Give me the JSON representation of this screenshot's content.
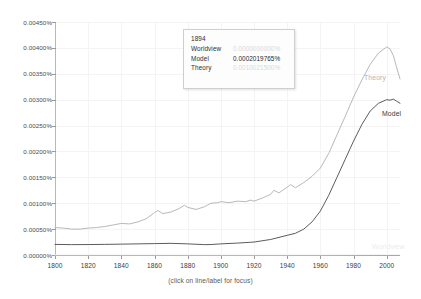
{
  "chart_data": {
    "type": "line",
    "title": "",
    "xlabel": "",
    "ylabel": "",
    "xlim": [
      1800,
      2008
    ],
    "ylim": [
      0,
      0.0045
    ],
    "grid": true,
    "legend_position": "line-end-labels",
    "y_tick_labels": [
      "0.00450%",
      "0.00400%",
      "0.00350%",
      "0.00300%",
      "0.00250%",
      "0.00200%",
      "0.00150%",
      "0.00100%",
      "0.00050%",
      "0.00000%"
    ],
    "y_tick_values": [
      0.0045,
      0.004,
      0.0035,
      0.003,
      0.0025,
      0.002,
      0.0015,
      0.001,
      0.0005,
      0.0
    ],
    "x_tick_labels": [
      "1800",
      "1820",
      "1840",
      "1860",
      "1880",
      "1900",
      "1920",
      "1940",
      "1960",
      "1980",
      "2000"
    ],
    "x_tick_values": [
      1800,
      1820,
      1840,
      1860,
      1880,
      1900,
      1920,
      1940,
      1960,
      1980,
      2000
    ],
    "series": [
      {
        "name": "Theory",
        "color": "#b0b0b0",
        "x": [
          1800,
          1805,
          1810,
          1815,
          1820,
          1825,
          1830,
          1835,
          1840,
          1845,
          1850,
          1855,
          1860,
          1862,
          1865,
          1870,
          1875,
          1878,
          1880,
          1885,
          1890,
          1894,
          1898,
          1900,
          1905,
          1910,
          1915,
          1918,
          1920,
          1925,
          1930,
          1932,
          1935,
          1940,
          1942,
          1945,
          1950,
          1955,
          1960,
          1965,
          1970,
          1975,
          1980,
          1985,
          1990,
          1995,
          2000,
          2002,
          2004,
          2006,
          2008
        ],
        "y": [
          0.00053,
          0.00052,
          0.0005,
          0.0005,
          0.00052,
          0.00053,
          0.00055,
          0.00058,
          0.00061,
          0.0006,
          0.00064,
          0.0007,
          0.00082,
          0.00086,
          0.0008,
          0.00083,
          0.0009,
          0.00096,
          0.00092,
          0.00088,
          0.00093,
          0.001,
          0.00101,
          0.00103,
          0.00101,
          0.00104,
          0.00103,
          0.00106,
          0.00104,
          0.0011,
          0.00117,
          0.00125,
          0.0012,
          0.00131,
          0.00136,
          0.0013,
          0.0014,
          0.00152,
          0.00168,
          0.00196,
          0.00232,
          0.00268,
          0.00305,
          0.00338,
          0.00368,
          0.0039,
          0.00402,
          0.00398,
          0.00385,
          0.00362,
          0.0034
        ]
      },
      {
        "name": "Model",
        "color": "#4a4a4a",
        "x": [
          1800,
          1810,
          1820,
          1830,
          1840,
          1850,
          1860,
          1870,
          1880,
          1890,
          1894,
          1900,
          1910,
          1920,
          1930,
          1940,
          1945,
          1950,
          1955,
          1960,
          1965,
          1970,
          1975,
          1980,
          1985,
          1990,
          1995,
          2000,
          2002,
          2004,
          2006,
          2008
        ],
        "y": [
          0.000205,
          0.0002,
          0.000202,
          0.000205,
          0.00021,
          0.000215,
          0.00022,
          0.000225,
          0.000215,
          0.0002,
          0.0002019765,
          0.000215,
          0.00023,
          0.00025,
          0.0003,
          0.00038,
          0.00042,
          0.0005,
          0.00064,
          0.00085,
          0.00115,
          0.0015,
          0.00185,
          0.0022,
          0.00252,
          0.00278,
          0.00293,
          0.003,
          0.00299,
          0.00301,
          0.00297,
          0.00293
        ]
      },
      {
        "name": "Worldview",
        "color": "#ededed",
        "x": [
          1800,
          1850,
          1900,
          1920,
          1940,
          1950,
          1960,
          1970,
          1980,
          1990,
          2000,
          2008
        ],
        "y": [
          0.0,
          0.0,
          0.0,
          0.0,
          0.0,
          2e-07,
          6e-07,
          1.2e-06,
          1.9e-06,
          2.6e-06,
          3.1e-06,
          3.3e-06
        ]
      }
    ]
  },
  "tooltip": {
    "year": "1894",
    "rows": [
      {
        "name": "Worldview",
        "value": "0.0000000000%",
        "state": "dim"
      },
      {
        "name": "Model",
        "value": "0.0002019765%",
        "state": "active"
      },
      {
        "name": "Theory",
        "value": "0.0010021500%",
        "state": "dim"
      }
    ]
  },
  "series_labels": {
    "theory": "Theory",
    "model": "Model",
    "worldview": "Worldview"
  },
  "caption": "(click on line/label for focus)"
}
